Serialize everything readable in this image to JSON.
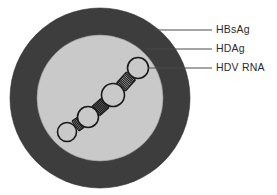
{
  "figure": {
    "background_color": "#ffffff"
  },
  "virion": {
    "outer_envelope": {
      "name": "HBsAg envelope",
      "color": "#3d3d3d",
      "center_x": 100,
      "center_y": 98,
      "radius": 90
    },
    "inner_core": {
      "name": "HDAg core",
      "color": "#c9c9c9",
      "center_x": 100,
      "center_y": 98,
      "radius": 63
    },
    "rna": {
      "name": "HDV RNA rod-like genome",
      "stroke_color": "#1a1a1a",
      "fill_color": "#c9c9c9",
      "loop_count": 4,
      "loops": [
        {
          "cx": 67,
          "cy": 132,
          "r": 9.5
        },
        {
          "cx": 88,
          "cy": 117,
          "r": 10.5
        },
        {
          "cx": 113,
          "cy": 95,
          "r": 11.5
        },
        {
          "cx": 138,
          "cy": 68,
          "r": 10.5
        }
      ],
      "duplex_segments": [
        {
          "x1": 75.5,
          "y1": 126,
          "x2": 80.5,
          "y2": 122.5,
          "rungs": 4
        },
        {
          "x1": 96,
          "y1": 111,
          "x2": 105,
          "y2": 103,
          "rungs": 8
        },
        {
          "x1": 121,
          "y1": 87,
          "x2": 131,
          "y2": 76,
          "rungs": 9
        }
      ]
    }
  },
  "labels": [
    {
      "id": "hbsag",
      "text": "HBsAg",
      "leader": {
        "x1": 155,
        "y1": 30,
        "x2": 212,
        "y2": 30
      },
      "text_x": 216,
      "text_y": 30
    },
    {
      "id": "hdag",
      "text": "HDAg",
      "leader": {
        "x1": 147,
        "y1": 49,
        "x2": 212,
        "y2": 49
      },
      "text_x": 216,
      "text_y": 49
    },
    {
      "id": "hdv-rna",
      "text": "HDV RNA",
      "leader": {
        "x1": 148,
        "y1": 68,
        "x2": 212,
        "y2": 68
      },
      "text_x": 216,
      "text_y": 68
    }
  ],
  "style": {
    "leader_color": "#4a4a4a",
    "leader_width": 1,
    "text_color": "#2b2b2b"
  }
}
